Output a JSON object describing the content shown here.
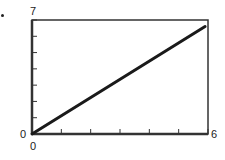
{
  "chart_data": {
    "type": "line",
    "title": "",
    "xlabel": "",
    "ylabel": "",
    "xlim": [
      0,
      6
    ],
    "ylim": [
      0,
      7
    ],
    "x_tick_labels": [
      "0",
      "6"
    ],
    "y_tick_labels": [
      "0",
      "7"
    ],
    "x_ticks": [
      0,
      1,
      2,
      3,
      4,
      5,
      6
    ],
    "y_ticks": [
      0,
      1,
      2,
      3,
      4,
      5,
      6,
      7
    ],
    "grid": false,
    "legend": null,
    "series": [
      {
        "name": "line",
        "x": [
          0,
          5.9
        ],
        "y": [
          0,
          6.6
        ]
      }
    ]
  },
  "labels": {
    "y_max": "7",
    "y_min": "0",
    "x_min": "0",
    "x_max": "6"
  },
  "style": {
    "line_color": "#1a1a1a",
    "frame_color": "#333333"
  }
}
